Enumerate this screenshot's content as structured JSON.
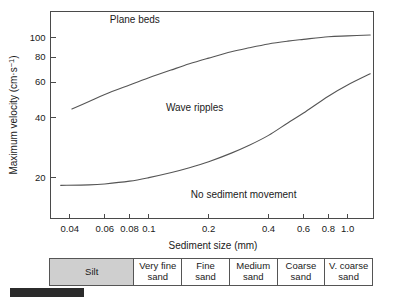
{
  "chart_data": {
    "type": "line",
    "title": "",
    "xlabel": "Sediment size (mm)",
    "ylabel": "Maximum velocity (cm·s⁻¹)",
    "xscale": "log",
    "yscale": "log",
    "xlim": [
      0.032,
      1.35
    ],
    "ylim": [
      12.5,
      135
    ],
    "grid": false,
    "legend": "none",
    "xticks": [
      {
        "value": 0.04,
        "label": "0.04"
      },
      {
        "value": 0.06,
        "label": "0.06"
      },
      {
        "value": 0.08,
        "label": "0.08"
      },
      {
        "value": 0.1,
        "label": "0.1"
      },
      {
        "value": 0.2,
        "label": "0.2"
      },
      {
        "value": 0.4,
        "label": "0.4"
      },
      {
        "value": 0.6,
        "label": "0.6"
      },
      {
        "value": 0.8,
        "label": "0.8"
      },
      {
        "value": 1.0,
        "label": "1.0"
      }
    ],
    "yticks": [
      {
        "value": 20,
        "label": "20"
      },
      {
        "value": 40,
        "label": "40"
      },
      {
        "value": 60,
        "label": "60"
      },
      {
        "value": 80,
        "label": "80"
      },
      {
        "value": 100,
        "label": "100"
      }
    ],
    "series": [
      {
        "name": "Plane beds / Wave ripples boundary",
        "x": [
          0.041,
          0.05,
          0.06,
          0.08,
          0.1,
          0.13,
          0.16,
          0.2,
          0.26,
          0.32,
          0.4,
          0.5,
          0.6,
          0.8,
          1.0,
          1.3
        ],
        "y": [
          44,
          48,
          52,
          58,
          63,
          69,
          74,
          79,
          85,
          89,
          93,
          96,
          98,
          101,
          102,
          103
        ]
      },
      {
        "name": "Wave ripples / No sediment movement boundary",
        "x": [
          0.036,
          0.05,
          0.06,
          0.08,
          0.1,
          0.13,
          0.16,
          0.2,
          0.26,
          0.32,
          0.4,
          0.5,
          0.6,
          0.8,
          1.0,
          1.3
        ],
        "y": [
          18.3,
          18.4,
          18.6,
          19.2,
          20.0,
          21.2,
          22.4,
          24.0,
          26.5,
          29.0,
          32.5,
          37.5,
          42.0,
          51.0,
          58.0,
          66.0
        ]
      }
    ],
    "annotations": [
      {
        "text": "Plane beds",
        "x": 0.085,
        "y": 118
      },
      {
        "text": "Wave ripples",
        "x": 0.17,
        "y": 43
      },
      {
        "text": "No sediment movement",
        "x": 0.3,
        "y": 15.8
      }
    ]
  },
  "grain_scale": {
    "cells": [
      {
        "label": "Silt",
        "shaded": true,
        "flex": 1.82
      },
      {
        "label": "Very fine\nsand",
        "shaded": false,
        "flex": 1.0
      },
      {
        "label": "Fine\nsand",
        "shaded": false,
        "flex": 1.0
      },
      {
        "label": "Medium\nsand",
        "shaded": false,
        "flex": 1.0
      },
      {
        "label": "Coarse\nsand",
        "shaded": false,
        "flex": 1.0
      },
      {
        "label": "V. coarse\nsand",
        "shaded": false,
        "flex": 1.0
      }
    ],
    "shade_color": "#cfcfcf",
    "border_color": "#555555"
  },
  "caption": {
    "bar_color": "#2b2b2b",
    "text": ""
  },
  "colors": {
    "curve": "#555555",
    "axis": "#4a4a4a",
    "text": "#1a1a1a",
    "background": "#ffffff"
  }
}
